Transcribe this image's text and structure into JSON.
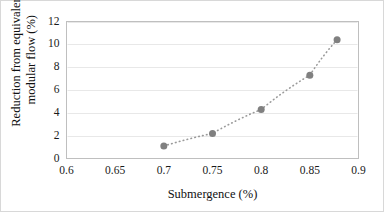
{
  "figure": {
    "background_color": "#ffffff",
    "border_color": "#d8d8d8"
  },
  "chart_data": {
    "type": "scatter",
    "title": "",
    "subtitle": "",
    "xlabel": "Submergence (%)",
    "ylabel_line1": "Reduction from equivalent",
    "ylabel_line2": "modular flow (%)",
    "ylabel": "Reduction from equivalent modular flow (%)",
    "xlim": [
      0.6,
      0.9
    ],
    "ylim": [
      0,
      12
    ],
    "xticks": [
      0.6,
      0.65,
      0.7,
      0.75,
      0.8,
      0.85,
      0.9
    ],
    "xtick_labels": [
      "0.6",
      "0.65",
      "0.7",
      "0.75",
      "0.8",
      "0.85",
      "0.9"
    ],
    "yticks": [
      0,
      2,
      4,
      6,
      8,
      10,
      12
    ],
    "ytick_labels": [
      "0",
      "2",
      "4",
      "6",
      "8",
      "10",
      "12"
    ],
    "grid": "horizontal",
    "grid_color": "#e8e8e8",
    "legend": "none",
    "marker_color": "#808080",
    "marker_shape": "circle",
    "marker_size": 7,
    "trendline": {
      "style": "dotted",
      "color": "#9a9a9a",
      "width": 1.6
    },
    "x": [
      0.7,
      0.75,
      0.8,
      0.85,
      0.878
    ],
    "y": [
      1.1,
      2.2,
      4.3,
      7.3,
      10.4
    ],
    "series": [
      {
        "name": "Reduction from equivalent modular flow",
        "points": [
          {
            "x": 0.7,
            "y": 1.1
          },
          {
            "x": 0.75,
            "y": 2.2
          },
          {
            "x": 0.8,
            "y": 4.3
          },
          {
            "x": 0.85,
            "y": 7.3
          },
          {
            "x": 0.878,
            "y": 10.4
          }
        ]
      }
    ]
  }
}
